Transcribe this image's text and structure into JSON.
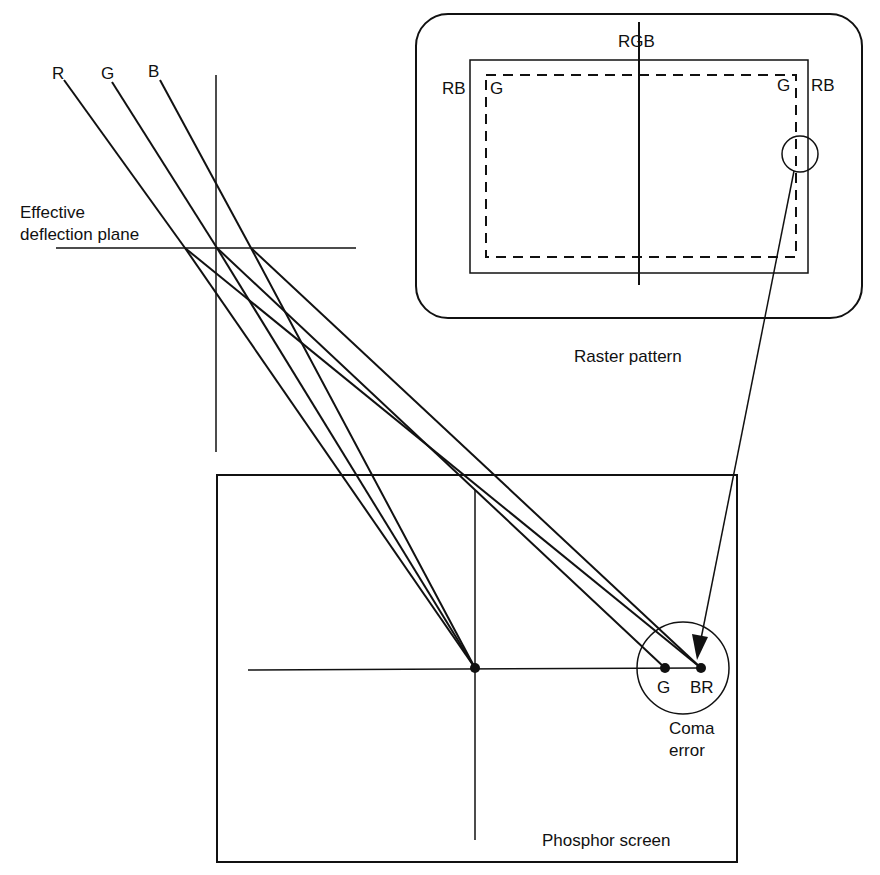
{
  "diagram": {
    "type": "crt-beam-coma-error",
    "colors": {
      "ink": "#111111",
      "background": "#ffffff"
    },
    "beams": [
      {
        "label": "R",
        "start": [
          64,
          80
        ],
        "deflection_point": [
          185,
          248
        ]
      },
      {
        "label": "G",
        "start": [
          112,
          82
        ],
        "deflection_point": [
          217,
          248
        ]
      },
      {
        "label": "B",
        "start": [
          160,
          80
        ],
        "deflection_point": [
          251,
          248
        ]
      }
    ],
    "labels": {
      "beam_r": "R",
      "beam_g": "G",
      "beam_b": "B",
      "deflection_plane": [
        "Effective",
        "deflection plane"
      ],
      "raster_top": "RGB",
      "raster_left_outer": "RB",
      "raster_left_inner": "G",
      "raster_right_inner": "G",
      "raster_right_outer": "RB",
      "raster_caption": "Raster pattern",
      "spot_g": "G",
      "spot_br": "BR",
      "coma_error": [
        "Coma",
        "error"
      ],
      "phosphor_screen": "Phosphor screen"
    },
    "screen": {
      "center_spot": [
        475,
        668
      ],
      "spot_g": [
        665,
        668
      ],
      "spot_br": [
        701,
        668
      ]
    }
  }
}
